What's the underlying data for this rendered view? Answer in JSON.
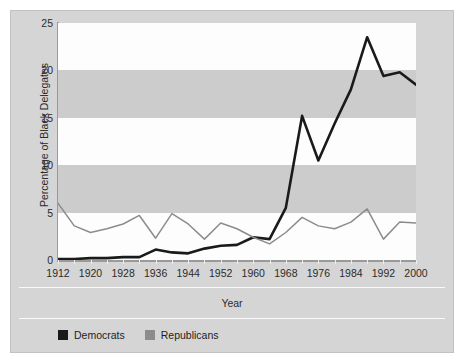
{
  "chart_data": {
    "type": "line",
    "title": "",
    "xlabel": "Year",
    "ylabel": "Percentage of Black Delegates",
    "xlim": [
      1912,
      2000
    ],
    "ylim": [
      0,
      25
    ],
    "ytick_labels": [
      "0",
      "5",
      "10",
      "15",
      "20",
      "25"
    ],
    "ytick_values": [
      0,
      5,
      10,
      15,
      20,
      25
    ],
    "xtick_labels": [
      "1912",
      "1920",
      "1928",
      "1936",
      "1944",
      "1952",
      "1960",
      "1968",
      "1976",
      "1984",
      "1992",
      "2000"
    ],
    "xtick_values": [
      1912,
      1920,
      1928,
      1936,
      1944,
      1952,
      1960,
      1968,
      1976,
      1984,
      1992,
      2000
    ],
    "grid": "alternating-horizontal-bands",
    "legend_position": "bottom-left",
    "x": [
      1912,
      1916,
      1920,
      1924,
      1928,
      1932,
      1936,
      1940,
      1944,
      1948,
      1952,
      1956,
      1960,
      1964,
      1968,
      1972,
      1976,
      1980,
      1984,
      1988,
      1992,
      1996,
      2000
    ],
    "series": [
      {
        "name": "Democrats",
        "color": "#1a1a1a",
        "values": [
          0.1,
          0.1,
          0.2,
          0.2,
          0.3,
          0.3,
          1.1,
          0.8,
          0.7,
          1.2,
          1.5,
          1.6,
          2.4,
          2.2,
          5.5,
          15.2,
          10.5,
          14.4,
          18.0,
          23.5,
          19.4,
          19.8,
          18.5
        ]
      },
      {
        "name": "Republicans",
        "color": "#8c8c8c",
        "values": [
          6.0,
          3.6,
          2.9,
          3.3,
          3.8,
          4.7,
          2.3,
          4.9,
          3.8,
          2.2,
          3.9,
          3.3,
          2.4,
          1.7,
          2.9,
          4.5,
          3.6,
          3.3,
          4.0,
          5.4,
          2.2,
          4.0,
          3.9
        ]
      }
    ]
  },
  "legend": {
    "items": [
      {
        "label": "Democrats",
        "color": "#1a1a1a"
      },
      {
        "label": "Republicans",
        "color": "#8c8c8c"
      }
    ]
  },
  "axes": {
    "y_title": "Percentage of Black Delegates",
    "x_title": "Year"
  }
}
